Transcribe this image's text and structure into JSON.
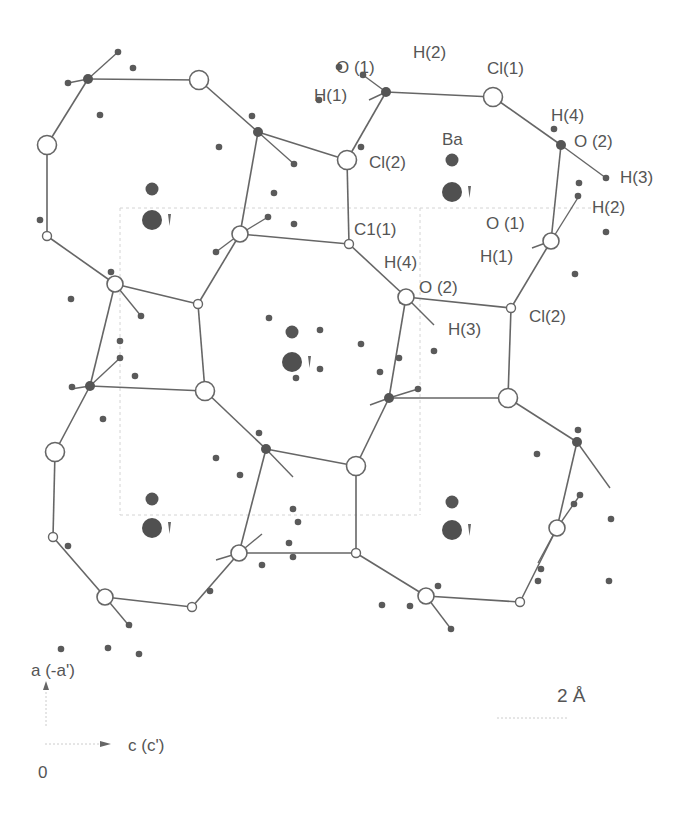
{
  "figure": {
    "colors": {
      "bond": "#666666",
      "atom_dark": "#555555",
      "text": "#555555",
      "background": "#ffffff"
    }
  },
  "labels": [
    {
      "id": "o1-top",
      "text": "O (1)",
      "x": 336,
      "y": 73
    },
    {
      "id": "h2-top",
      "text": "H(2)",
      "x": 413,
      "y": 58
    },
    {
      "id": "h1-top",
      "text": "H(1)",
      "x": 314,
      "y": 101
    },
    {
      "id": "cl1-top",
      "text": "Cl(1)",
      "x": 487,
      "y": 74
    },
    {
      "id": "ba-top",
      "text": "Ba",
      "x": 442,
      "y": 145
    },
    {
      "id": "cl2-top",
      "text": "Cl(2)",
      "x": 369,
      "y": 168
    },
    {
      "id": "h4-top",
      "text": "H(4)",
      "x": 551,
      "y": 121
    },
    {
      "id": "o2-top",
      "text": "O (2)",
      "x": 574,
      "y": 147
    },
    {
      "id": "h3-top",
      "text": "H(3)",
      "x": 620,
      "y": 183
    },
    {
      "id": "h2-right",
      "text": "H(2)",
      "x": 592,
      "y": 213
    },
    {
      "id": "o1-right",
      "text": "O (1)",
      "x": 486,
      "y": 229
    },
    {
      "id": "c11-mid",
      "text": "C1(1)",
      "x": 354,
      "y": 235
    },
    {
      "id": "h1-right",
      "text": "H(1)",
      "x": 480,
      "y": 262
    },
    {
      "id": "h4-mid",
      "text": "H(4)",
      "x": 384,
      "y": 268
    },
    {
      "id": "o2-mid",
      "text": "O (2)",
      "x": 419,
      "y": 293
    },
    {
      "id": "cl2-right",
      "text": "Cl(2)",
      "x": 529,
      "y": 322
    },
    {
      "id": "h3-mid",
      "text": "H(3)",
      "x": 448,
      "y": 335
    }
  ],
  "axes": {
    "a_label": "a (-a')",
    "c_label": "c (c')",
    "origin_label": "0",
    "scale_label": "2 Å"
  },
  "atoms": {
    "cl_big": [
      [
        199,
        80
      ],
      [
        493,
        97
      ],
      [
        47,
        145
      ],
      [
        347,
        160
      ],
      [
        205,
        391
      ],
      [
        508,
        398
      ],
      [
        55,
        452
      ],
      [
        356,
        466
      ]
    ],
    "cl_small": [
      [
        47,
        236
      ],
      [
        198,
        304
      ],
      [
        349,
        244
      ],
      [
        511,
        308
      ],
      [
        53,
        537
      ],
      [
        192,
        607
      ],
      [
        356,
        553
      ],
      [
        520,
        602
      ]
    ],
    "cl_ring": [
      [
        240,
        234
      ],
      [
        115,
        284
      ],
      [
        551,
        241
      ],
      [
        406,
        297
      ],
      [
        239,
        553
      ],
      [
        105,
        597
      ],
      [
        557,
        528
      ],
      [
        426,
        596
      ]
    ],
    "o_dark": [
      [
        88,
        79
      ],
      [
        258,
        132
      ],
      [
        386,
        92
      ],
      [
        561,
        145
      ],
      [
        90,
        386
      ],
      [
        266,
        449
      ],
      [
        389,
        398
      ],
      [
        577,
        442
      ]
    ],
    "h_atoms": [
      [
        118,
        52
      ],
      [
        68,
        83
      ],
      [
        133,
        68
      ],
      [
        100,
        115
      ],
      [
        252,
        116
      ],
      [
        294,
        164
      ],
      [
        219,
        147
      ],
      [
        40,
        220
      ],
      [
        68,
        546
      ],
      [
        61,
        649
      ],
      [
        319,
        100
      ],
      [
        339,
        67
      ],
      [
        363,
        75
      ],
      [
        361,
        147
      ],
      [
        554,
        129
      ],
      [
        606,
        178
      ],
      [
        578,
        196
      ],
      [
        579,
        183
      ],
      [
        606,
        232
      ],
      [
        575,
        274
      ],
      [
        268,
        217
      ],
      [
        274,
        193
      ],
      [
        294,
        224
      ],
      [
        216,
        252
      ],
      [
        269,
        318
      ],
      [
        111,
        272
      ],
      [
        141,
        316
      ],
      [
        120,
        341
      ],
      [
        120,
        358
      ],
      [
        135,
        376
      ],
      [
        71,
        299
      ],
      [
        72,
        387
      ],
      [
        103,
        419
      ],
      [
        216,
        458
      ],
      [
        240,
        475
      ],
      [
        259,
        433
      ],
      [
        289,
        543
      ],
      [
        293,
        557
      ],
      [
        262,
        565
      ],
      [
        210,
        591
      ],
      [
        129,
        625
      ],
      [
        108,
        648
      ],
      [
        139,
        654
      ],
      [
        320,
        330
      ],
      [
        296,
        378
      ],
      [
        320,
        369
      ],
      [
        298,
        522
      ],
      [
        293,
        509
      ],
      [
        402,
        301
      ],
      [
        434,
        351
      ],
      [
        361,
        344
      ],
      [
        399,
        358
      ],
      [
        418,
        389
      ],
      [
        380,
        372
      ],
      [
        438,
        586
      ],
      [
        410,
        606
      ],
      [
        451,
        629
      ],
      [
        382,
        605
      ],
      [
        538,
        581
      ],
      [
        541,
        569
      ],
      [
        609,
        581
      ],
      [
        578,
        430
      ],
      [
        537,
        454
      ],
      [
        574,
        504
      ],
      [
        611,
        519
      ],
      [
        580,
        495
      ]
    ],
    "ba_small": [
      [
        152,
        189
      ],
      [
        452,
        160
      ],
      [
        292,
        332
      ],
      [
        152,
        499
      ],
      [
        452,
        502
      ]
    ],
    "ba_big": [
      [
        152,
        220
      ],
      [
        452,
        192
      ],
      [
        292,
        362
      ],
      [
        152,
        528
      ],
      [
        452,
        530
      ]
    ]
  },
  "bonds": [
    [
      88,
      79,
      199,
      80
    ],
    [
      88,
      79,
      47,
      145
    ],
    [
      199,
      80,
      258,
      132
    ],
    [
      47,
      145,
      47,
      236
    ],
    [
      47,
      236,
      115,
      284
    ],
    [
      258,
      132,
      347,
      160
    ],
    [
      258,
      132,
      240,
      234
    ],
    [
      347,
      160,
      386,
      92
    ],
    [
      386,
      92,
      493,
      97
    ],
    [
      493,
      97,
      561,
      145
    ],
    [
      561,
      145,
      551,
      241
    ],
    [
      347,
      160,
      349,
      244
    ],
    [
      240,
      234,
      349,
      244
    ],
    [
      240,
      234,
      198,
      304
    ],
    [
      349,
      244,
      406,
      297
    ],
    [
      551,
      241,
      511,
      308
    ],
    [
      406,
      297,
      511,
      308
    ],
    [
      511,
      308,
      508,
      398
    ],
    [
      406,
      297,
      389,
      398
    ],
    [
      115,
      284,
      198,
      304
    ],
    [
      198,
      304,
      205,
      391
    ],
    [
      115,
      284,
      90,
      386
    ],
    [
      205,
      391,
      266,
      449
    ],
    [
      90,
      386,
      205,
      391
    ],
    [
      90,
      386,
      55,
      452
    ],
    [
      55,
      452,
      53,
      537
    ],
    [
      53,
      537,
      105,
      597
    ],
    [
      266,
      449,
      356,
      466
    ],
    [
      266,
      449,
      239,
      553
    ],
    [
      389,
      398,
      508,
      398
    ],
    [
      389,
      398,
      356,
      466
    ],
    [
      508,
      398,
      577,
      442
    ],
    [
      577,
      442,
      557,
      528
    ],
    [
      356,
      466,
      356,
      553
    ],
    [
      239,
      553,
      356,
      553
    ],
    [
      239,
      553,
      192,
      607
    ],
    [
      105,
      597,
      192,
      607
    ],
    [
      356,
      553,
      426,
      596
    ],
    [
      557,
      528,
      520,
      602
    ],
    [
      426,
      596,
      520,
      602
    ]
  ],
  "h_bonds": [
    [
      88,
      79,
      118,
      52
    ],
    [
      88,
      79,
      68,
      83
    ],
    [
      258,
      132,
      294,
      164
    ],
    [
      386,
      92,
      363,
      75
    ],
    [
      386,
      92,
      369,
      100
    ],
    [
      561,
      145,
      606,
      178
    ],
    [
      551,
      241,
      579,
      196
    ],
    [
      551,
      241,
      532,
      248
    ],
    [
      406,
      297,
      434,
      325
    ],
    [
      240,
      234,
      268,
      217
    ],
    [
      240,
      234,
      216,
      252
    ],
    [
      115,
      284,
      141,
      316
    ],
    [
      90,
      386,
      120,
      358
    ],
    [
      90,
      386,
      71,
      389
    ],
    [
      266,
      449,
      293,
      477
    ],
    [
      389,
      398,
      418,
      389
    ],
    [
      389,
      398,
      370,
      405
    ],
    [
      239,
      553,
      262,
      534
    ],
    [
      239,
      553,
      216,
      560
    ],
    [
      105,
      597,
      131,
      628
    ],
    [
      426,
      596,
      451,
      629
    ],
    [
      557,
      528,
      580,
      495
    ],
    [
      557,
      528,
      538,
      563
    ],
    [
      577,
      442,
      610,
      488
    ]
  ]
}
